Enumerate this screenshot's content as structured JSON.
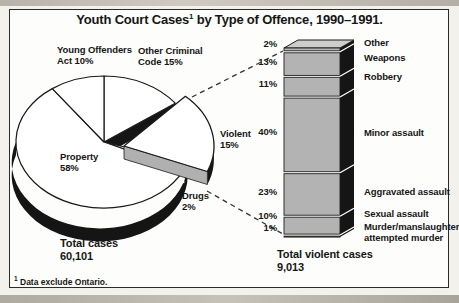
{
  "title": {
    "main": "Youth Court Cases",
    "sup": "1",
    "rest": " by Type of Offence, 1990–1991."
  },
  "footnote": {
    "sup": "1",
    "text": "Data exclude Ontario."
  },
  "pie": {
    "total_label": "Total cases",
    "total_value": "60,101",
    "slices": [
      {
        "name": "Other Criminal Code",
        "pct": 15,
        "display": "Other Criminal\nCode 15%"
      },
      {
        "name": "Violent",
        "pct": 15,
        "display": "Violent\n15%",
        "exploded": true
      },
      {
        "name": "Drugs",
        "pct": 2,
        "display": "Drugs\n2%"
      },
      {
        "name": "Property",
        "pct": 58,
        "display": "Property\n58%"
      },
      {
        "name": "Young Offenders Act",
        "pct": 10,
        "display": "Young Offenders\nAct 10%"
      }
    ]
  },
  "bar": {
    "total_label": "Total violent cases",
    "total_value": "9,013",
    "segments": [
      {
        "label": "Other",
        "pct": 2,
        "pct_display": "2%"
      },
      {
        "label": "Weapons",
        "pct": 13,
        "pct_display": "13%"
      },
      {
        "label": "Robbery",
        "pct": 11,
        "pct_display": "11%"
      },
      {
        "label": "Minor assault",
        "pct": 40,
        "pct_display": "40%"
      },
      {
        "label": "Aggravated assault",
        "pct": 23,
        "pct_display": "23%"
      },
      {
        "label": "Sexual assault",
        "pct": 10,
        "pct_display": "10%"
      },
      {
        "label": "Murder/manslaughter/\nattempted murder",
        "pct": 1,
        "pct_display": "1%"
      }
    ]
  },
  "colors": {
    "ink": "#1a1a1a",
    "dark": "#151515",
    "bar_face": "#b3b3b3",
    "bar_top": "#cdcdcd",
    "pie_side_gray": "#b0b0b0",
    "paper": "#ffffff"
  },
  "chart_data": [
    {
      "type": "pie",
      "title": "Youth Court Cases by Type of Offence, 1990–1991",
      "unit": "% of total cases",
      "labels": [
        "Other Criminal Code",
        "Violent",
        "Drugs",
        "Property",
        "Young Offenders Act"
      ],
      "values": [
        15,
        15,
        2,
        58,
        10
      ],
      "total_label": "Total cases",
      "total_value": "60,101",
      "exploded_slice": "Violent",
      "style": "3d-exploded-monochrome",
      "footnote": "Data exclude Ontario."
    },
    {
      "type": "bar",
      "subtype": "stacked-100-percent",
      "orientation": "vertical-single-column",
      "categories": [
        "Other",
        "Weapons",
        "Robbery",
        "Minor assault",
        "Aggravated assault",
        "Sexual assault",
        "Murder/manslaughter/attempted murder"
      ],
      "values": [
        2,
        13,
        11,
        40,
        23,
        10,
        1
      ],
      "total_label": "Total violent cases",
      "total_value": "9,013",
      "ylim": [
        0,
        100
      ],
      "style": "3d-column-monochrome"
    }
  ]
}
